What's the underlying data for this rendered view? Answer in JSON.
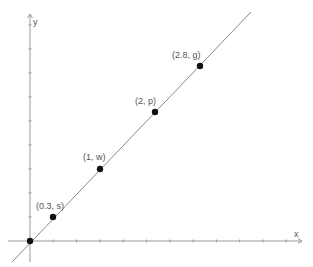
{
  "diagram": {
    "type": "coordinate-plot",
    "axes": {
      "x_label": "x",
      "y_label": "y",
      "color": "#9a9a9a"
    },
    "line": {
      "color": "#8a8a8a",
      "x1": 12,
      "y1": 262,
      "x2": 251,
      "y2": 12
    },
    "points": [
      {
        "label": "(0, 0)",
        "px": 30,
        "py": 241,
        "show_label": false
      },
      {
        "label": "(0.3, s)",
        "px": 53,
        "py": 217,
        "lx": 36,
        "ly": 209,
        "show_label": true
      },
      {
        "label": "(1, w)",
        "px": 100,
        "py": 169,
        "lx": 83,
        "ly": 160,
        "show_label": true
      },
      {
        "label": "(2, p)",
        "px": 155,
        "py": 112,
        "lx": 135,
        "ly": 104,
        "show_label": true
      },
      {
        "label": "(2.8, g)",
        "px": 200,
        "py": 66,
        "lx": 172,
        "ly": 58,
        "show_label": true
      }
    ],
    "point_color": "#111111"
  }
}
